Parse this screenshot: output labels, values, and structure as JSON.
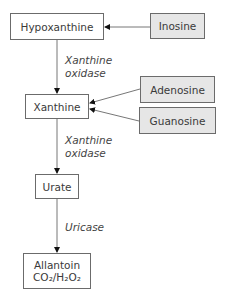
{
  "diagram": {
    "type": "metabolic-pathway",
    "nodes": {
      "hypoxanthine": {
        "label": "Hypoxanthine",
        "fill": "#ffffff"
      },
      "inosine": {
        "label": "Inosine",
        "fill": "#e6e6e6"
      },
      "xanthine": {
        "label": "Xanthine",
        "fill": "#ffffff"
      },
      "adenosine": {
        "label": "Adenosine",
        "fill": "#e6e6e6"
      },
      "guanosine": {
        "label": "Guanosine",
        "fill": "#e6e6e6"
      },
      "urate": {
        "label": "Urate",
        "fill": "#ffffff"
      },
      "allantoin": {
        "label": "Allantoin",
        "products_line": "CO₂/H₂O₂"
      }
    },
    "enzymes": {
      "xo1": {
        "line1": "Xanthine",
        "line2": "oxidase"
      },
      "xo2": {
        "line1": "Xanthine",
        "line2": "oxidase"
      },
      "uricase": {
        "line1": "Uricase"
      }
    },
    "edges": [
      {
        "from": "inosine",
        "to": "hypoxanthine"
      },
      {
        "from": "hypoxanthine",
        "to": "xanthine",
        "enzyme": "Xanthine oxidase"
      },
      {
        "from": "adenosine",
        "to": "xanthine"
      },
      {
        "from": "guanosine",
        "to": "xanthine"
      },
      {
        "from": "xanthine",
        "to": "urate",
        "enzyme": "Xanthine oxidase"
      },
      {
        "from": "urate",
        "to": "allantoin",
        "enzyme": "Uricase"
      }
    ]
  }
}
